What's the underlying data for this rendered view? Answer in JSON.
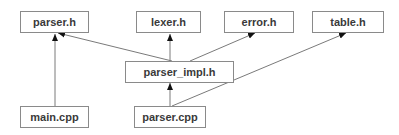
{
  "diagram": {
    "type": "dependency-graph",
    "nodes": [
      {
        "id": "parser_h",
        "label": "parser.h"
      },
      {
        "id": "lexer_h",
        "label": "lexer.h"
      },
      {
        "id": "error_h",
        "label": "error.h"
      },
      {
        "id": "table_h",
        "label": "table.h"
      },
      {
        "id": "parser_impl_h",
        "label": "parser_impl.h"
      },
      {
        "id": "main_cpp",
        "label": "main.cpp"
      },
      {
        "id": "parser_cpp",
        "label": "parser.cpp"
      }
    ],
    "edges": [
      {
        "from": "parser_impl_h",
        "to": "parser_h"
      },
      {
        "from": "parser_impl_h",
        "to": "lexer_h"
      },
      {
        "from": "parser_impl_h",
        "to": "error_h"
      },
      {
        "from": "main_cpp",
        "to": "parser_h"
      },
      {
        "from": "parser_cpp",
        "to": "parser_impl_h"
      },
      {
        "from": "parser_cpp",
        "to": "table_h"
      }
    ],
    "colors": {
      "border": "#8a8a8a",
      "text": "#3a3a3a",
      "edge": "#7a7a7a",
      "arrowhead": "#111111"
    }
  }
}
